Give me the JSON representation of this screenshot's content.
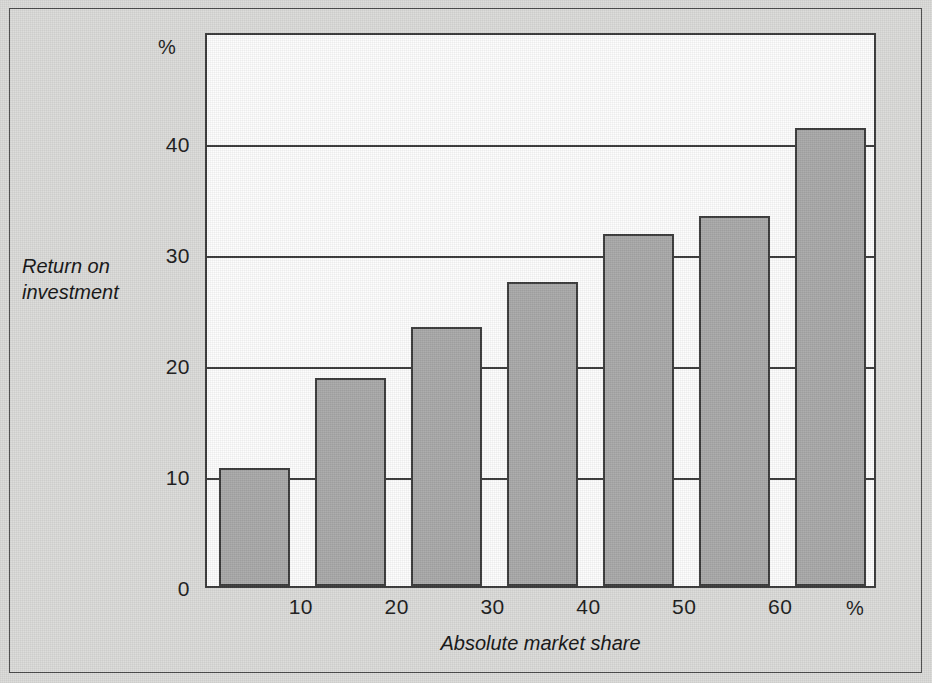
{
  "chart_data": {
    "type": "bar",
    "title": "",
    "xlabel": "Absolute market share",
    "ylabel": "Return on investment",
    "x_unit": "%",
    "y_unit": "%",
    "categories": [
      "0-10",
      "10-20",
      "20-30",
      "30-40",
      "40-50",
      "50-60",
      "60-70"
    ],
    "values": [
      10.6,
      18.7,
      23.3,
      27.4,
      31.7,
      33.3,
      41.3
    ],
    "x_ticks": [
      "10",
      "20",
      "30",
      "40",
      "50",
      "60"
    ],
    "x_tick_values": [
      10,
      20,
      30,
      40,
      50,
      60
    ],
    "y_ticks": [
      "0",
      "10",
      "20",
      "30",
      "40"
    ],
    "y_tick_values": [
      0,
      10,
      20,
      30,
      40
    ],
    "xlim": [
      0,
      70
    ],
    "ylim": [
      0,
      50
    ],
    "grid": "horizontal",
    "legend": "none",
    "bar_color": "#a9a9a9",
    "bar_edge_color": "#3b3b3b",
    "axis_color": "#3a3a3a",
    "plot_background": "#fdfdfd",
    "figure_background": "#dbdbd9"
  },
  "axis": {
    "y_title_line1": "Return on",
    "y_title_line2": "investment",
    "x_title": "Absolute market share",
    "y_unit_label": "%",
    "x_unit_label": "%"
  }
}
